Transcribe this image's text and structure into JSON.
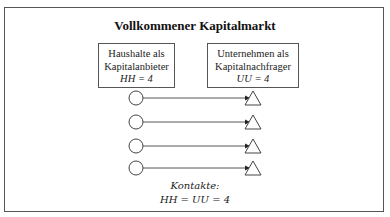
{
  "title": "Vollkommener Kapitalmarkt",
  "suppliers": {
    "line1": "Haushalte als",
    "line2": "Kapitalanbieter",
    "formula": "HH = 4"
  },
  "demanders": {
    "line1": "Unternehmen als",
    "line2": "Kapitalnachfrager",
    "formula": "UU = 4"
  },
  "connections": [
    {
      "from": "household-1",
      "to": "company-1"
    },
    {
      "from": "household-2",
      "to": "company-2"
    },
    {
      "from": "household-3",
      "to": "company-3"
    },
    {
      "from": "household-4",
      "to": "company-4"
    }
  ],
  "contacts": {
    "label": "Kontakte:",
    "formula": "HH = UU = 4"
  },
  "colors": {
    "stroke": "#444444",
    "background": "#ffffff"
  }
}
